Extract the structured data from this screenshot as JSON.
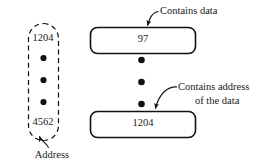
{
  "figure": {
    "type": "pointer-memory-diagram",
    "background_color": "#ffffff",
    "ink_color": "#000000"
  },
  "address_column": {
    "name": "dashed-address-column",
    "border_style": "dashed",
    "top_value": "1204",
    "bottom_value": "4562",
    "ellipsis_dot_count": 3,
    "caption": "Address"
  },
  "cells": [
    {
      "name": "data-cell",
      "value": "97",
      "annotation": "Contains data",
      "border_style": "solid"
    },
    {
      "name": "pointer-cell",
      "value": "1204",
      "annotation_line1": "Contains address",
      "annotation_line2": "of the data",
      "border_style": "solid"
    }
  ],
  "middle_ellipsis_dot_count": 3,
  "annotations": {
    "contains_data": "Contains data",
    "contains_address_line1": "Contains address",
    "contains_address_line2": "of the data",
    "address": "Address"
  }
}
